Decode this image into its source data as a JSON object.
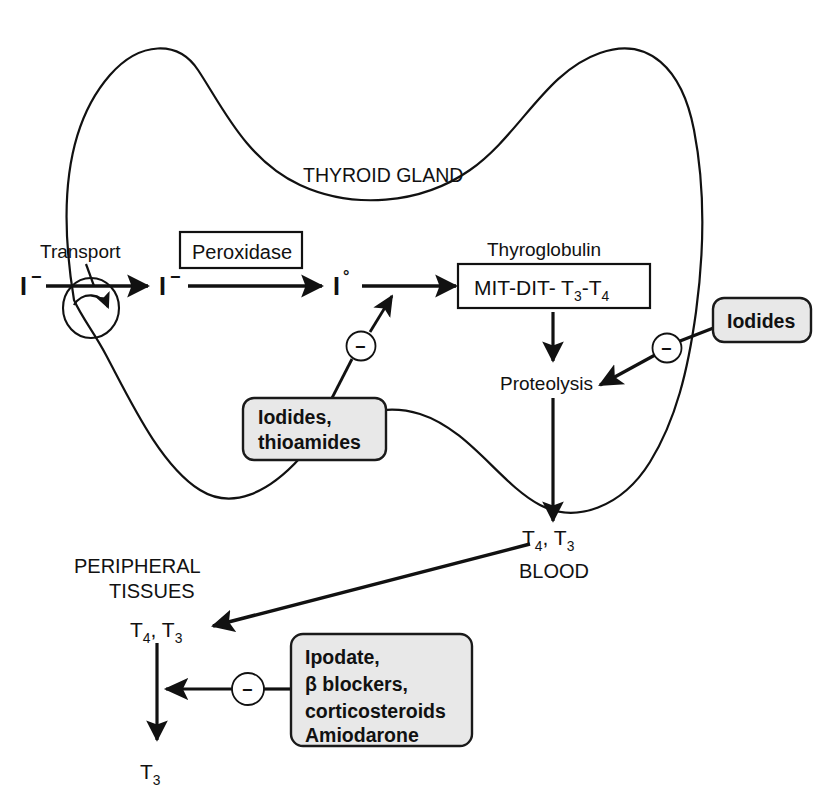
{
  "diagram": {
    "gland_label": "THYROID GLAND",
    "colors": {
      "stroke": "#111111",
      "drug_box_fill": "#e8e8e8",
      "drug_box_stroke": "#1a1a1a",
      "text": "#111111",
      "background": "#ffffff"
    },
    "gland_nodes": {
      "transport_label": "Transport",
      "iodide_in": "I",
      "iodide_in_charge": "−",
      "iodide_cell": "I",
      "iodide_cell_charge": "−",
      "iodine_atomic": "I",
      "iodine_atomic_charge": "°",
      "peroxidase_label": "Peroxidase",
      "thyroglobulin_label": "Thyroglobulin",
      "mit_dit_prefix": "MIT-DIT- T",
      "mit_dit_sub1": "3",
      "mit_dit_mid": "-T",
      "mit_dit_sub2": "4",
      "proteolysis_label": "Proteolysis"
    },
    "drug_boxes": [
      {
        "id": "iodides-thioamides",
        "lines": [
          "Iodides,",
          "thioamides"
        ]
      },
      {
        "id": "iodides",
        "lines": [
          "Iodides"
        ]
      },
      {
        "id": "peripheral-drugs",
        "lines": [
          "Ipodate,",
          "β blockers,",
          "corticosteroids",
          "Amiodarone"
        ]
      }
    ],
    "inhibition_markers": [
      {
        "id": "inhibit-peroxidase",
        "symbol": "−"
      },
      {
        "id": "inhibit-proteolysis",
        "symbol": "−"
      },
      {
        "id": "inhibit-peripheral-conversion",
        "symbol": "−"
      }
    ],
    "blood": {
      "hormones_prefix": "T",
      "hormones_sub1": "4",
      "hormones_mid": ", T",
      "hormones_sub2": "3",
      "compartment_label": "BLOOD"
    },
    "peripheral": {
      "title_line1": "PERIPHERAL",
      "title_line2": "TISSUES",
      "hormones_prefix": "T",
      "hormones_sub1": "4",
      "hormones_mid": ", T",
      "hormones_sub2": "3",
      "product_prefix": "T",
      "product_sub": "3"
    }
  }
}
